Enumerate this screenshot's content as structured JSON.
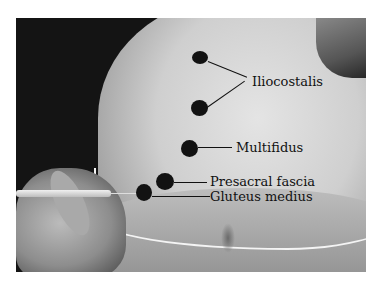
{
  "figure": {
    "labels": {
      "iliocostalis": "Iliocostalis",
      "multifidus": "Multifidus",
      "presacral_fascia": "Presacral fascia",
      "gluteus_medius": "Gluteus medius"
    }
  }
}
